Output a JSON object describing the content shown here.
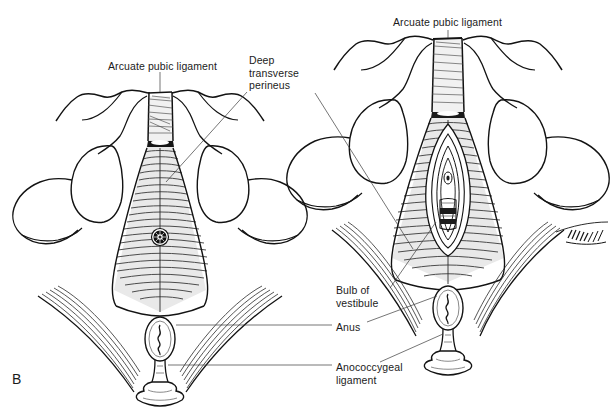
{
  "figure": {
    "panel_letter": "B",
    "background_color": "#ffffff",
    "ink_color": "#131313",
    "leader_color": "#3b3b3b",
    "text_color": "#1b1b1b"
  },
  "annotations": [
    {
      "id": "arcuate-pubic-ligament-left",
      "text": "Arcuate pubic ligament",
      "x": 108,
      "y": 60,
      "align": "left",
      "target": "left figure pubic arch apex"
    },
    {
      "id": "deep-transverse-perineus",
      "text": "Deep\ntransverse\nperineus",
      "x": 249,
      "y": 54,
      "align": "left",
      "target": "urogenital diaphragm of both figures"
    },
    {
      "id": "arcuate-pubic-ligament-right",
      "text": "Arcuate pubic ligament",
      "x": 393,
      "y": 16,
      "align": "left",
      "target": "right figure pubic arch apex"
    },
    {
      "id": "bulb-of-vestibule",
      "text": "Bulb of\nvestibule",
      "x": 336,
      "y": 284,
      "align": "left",
      "target": "right figure vestibular bulb"
    },
    {
      "id": "anus",
      "text": "Anus",
      "x": 336,
      "y": 321,
      "align": "left",
      "target": "anal orifice of both figures"
    },
    {
      "id": "anococcygeal-ligament",
      "text": "Anococcygeal\nligament",
      "x": 336,
      "y": 361,
      "align": "left",
      "target": "anococcygeal raphe of both figures"
    }
  ],
  "figures": [
    {
      "id": "left-figure",
      "sex": "male",
      "view": "inferior view of pelvic outlet",
      "center_x": 160,
      "structures": [
        "pubic arch",
        "arcuate pubic ligament",
        "deep transverse perineus muscle",
        "urethral orifice",
        "ischial tuberosity",
        "anus",
        "anococcygeal ligament",
        "coccyx"
      ]
    },
    {
      "id": "right-figure",
      "sex": "female",
      "view": "inferior view of pelvic outlet",
      "center_x": 448,
      "structures": [
        "pubic arch",
        "arcuate pubic ligament",
        "deep transverse perineus muscle",
        "vaginal orifice",
        "bulb of vestibule",
        "ischial tuberosity",
        "anus",
        "anococcygeal ligament",
        "coccyx"
      ]
    }
  ]
}
